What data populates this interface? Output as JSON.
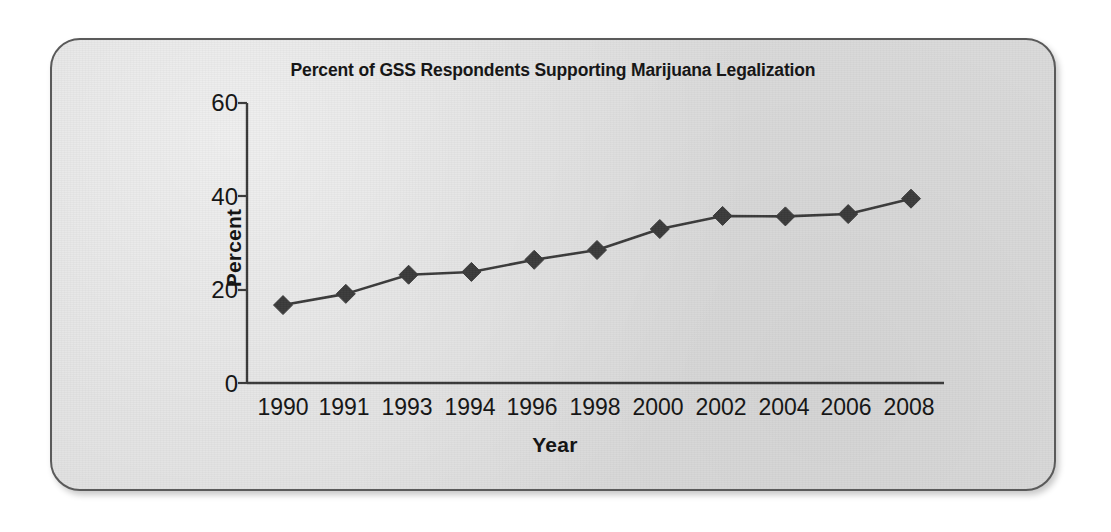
{
  "figure": {
    "background_color": "#dcdcdc",
    "frame_color": "#5a5a5a",
    "page_background": "#ffffff"
  },
  "chart_data": {
    "type": "line",
    "title": "Percent of GSS Respondents Supporting Marijuana Legalization",
    "xlabel": "Year",
    "ylabel": "Percent",
    "categories": [
      "1990",
      "1991",
      "1993",
      "1994",
      "1996",
      "1998",
      "2000",
      "2002",
      "2004",
      "2006",
      "2008"
    ],
    "values": [
      16.7,
      19.1,
      23.2,
      23.8,
      26.4,
      28.5,
      33.0,
      35.8,
      35.7,
      36.2,
      39.5
    ],
    "series": [
      {
        "name": "Percent supporting legalization",
        "values": [
          16.7,
          19.1,
          23.2,
          23.8,
          26.4,
          28.5,
          33.0,
          35.8,
          35.7,
          36.2,
          39.5
        ],
        "marker": "diamond",
        "marker_color": "#3b3b3b",
        "line_color": "#3b3b3b"
      }
    ],
    "ylim": [
      0,
      60
    ],
    "yticks": [
      0,
      20,
      40,
      60
    ],
    "ytick_labels": [
      "0",
      "20",
      "40",
      "60"
    ],
    "xtick_labels": [
      "1990",
      "1991",
      "1993",
      "1994",
      "1996",
      "1998",
      "2000",
      "2002",
      "2004",
      "2006",
      "2008"
    ],
    "grid": false,
    "legend": false,
    "legend_position": "none",
    "annotations": []
  }
}
